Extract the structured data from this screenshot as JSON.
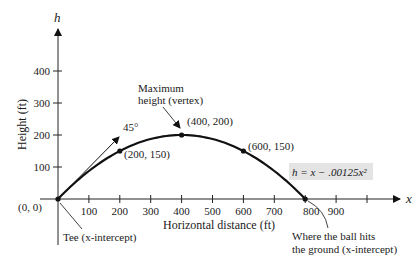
{
  "chart_data": {
    "type": "line",
    "title": "",
    "xlabel": "Horizontal distance (ft)",
    "ylabel": "Height (ft)",
    "x_axis_symbol": "x",
    "y_axis_symbol": "h",
    "xlim": [
      0,
      1000
    ],
    "ylim": [
      0,
      450
    ],
    "x_ticks": [
      100,
      200,
      300,
      400,
      500,
      600,
      700,
      800,
      900,
      1000
    ],
    "x_tick_labels": [
      "100",
      "200",
      "300",
      "400",
      "500",
      "600",
      "700",
      "800",
      "900"
    ],
    "y_ticks": [
      100,
      200,
      300,
      400
    ],
    "y_tick_labels": [
      "100",
      "200",
      "300",
      "400"
    ],
    "grid": false,
    "series": [
      {
        "name": "h = x - .00125x^2",
        "x": [
          0,
          100,
          200,
          300,
          400,
          500,
          600,
          700,
          800
        ],
        "values": [
          0,
          87.5,
          150,
          187.5,
          200,
          187.5,
          150,
          87.5,
          0
        ]
      }
    ],
    "points": [
      {
        "x": 0,
        "y": 0,
        "label": "(0, 0)"
      },
      {
        "x": 200,
        "y": 150,
        "label": "(200, 150)"
      },
      {
        "x": 400,
        "y": 200,
        "label": "(400, 200)"
      },
      {
        "x": 600,
        "y": 150,
        "label": "(600, 150)"
      },
      {
        "x": 800,
        "y": 0,
        "label": ""
      }
    ],
    "annotations": {
      "equation": "h = x − .00125x²",
      "angle": "45°",
      "vertex_line1": "Maximum",
      "vertex_line2": "height (vertex)",
      "tee": "Tee (x-intercept)",
      "ground_line1": "Where the ball hits",
      "ground_line2": "the ground (x-intercept)"
    },
    "colors": {
      "curve": "#111111",
      "equation_box": "#e4e4e4"
    }
  }
}
